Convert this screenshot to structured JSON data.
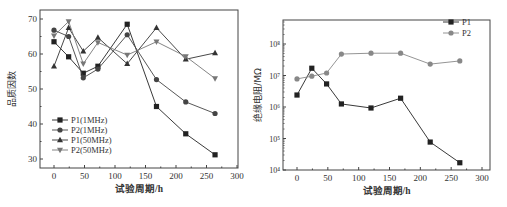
{
  "chart_data": [
    {
      "type": "line",
      "title": "",
      "xlabel": "试验周期/h",
      "ylabel": "品质因数",
      "xlim": [
        -25,
        300
      ],
      "ylim": [
        27.5,
        73
      ],
      "xticks": [
        0,
        50,
        100,
        150,
        200,
        250,
        300
      ],
      "yticks": [
        30,
        40,
        50,
        60,
        70
      ],
      "grid": false,
      "legend_position": "lower left",
      "x": [
        0,
        24,
        48,
        72,
        120,
        168,
        216,
        264
      ],
      "series": [
        {
          "name": "P1(1MHz)",
          "marker": "square",
          "color": "#222222",
          "values": [
            63.5,
            59.2,
            54.5,
            56.5,
            68.5,
            45.0,
            37.2,
            31.2
          ]
        },
        {
          "name": "P2(1MHz)",
          "marker": "circle",
          "color": "#444444",
          "values": [
            66.8,
            65.0,
            53.2,
            55.7,
            65.5,
            52.7,
            46.3,
            43.0
          ]
        },
        {
          "name": "P1(50MHz)",
          "marker": "triangle-up",
          "color": "#333333",
          "values": [
            56.5,
            67.5,
            60.8,
            64.7,
            57.2,
            67.5,
            58.5,
            60.3
          ]
        },
        {
          "name": "P2(50MHz)",
          "marker": "triangle-down",
          "color": "#777777",
          "values": [
            65.2,
            69.3,
            57.2,
            63.3,
            59.7,
            63.5,
            59.3,
            53.0
          ]
        }
      ]
    },
    {
      "type": "line",
      "title": "",
      "xlabel": "试验周期/h",
      "ylabel": "绝缘电阻/MΩ",
      "yscale": "log",
      "xlim": [
        -25,
        300
      ],
      "ylim": [
        10000,
        500000000
      ],
      "xticks": [
        0,
        50,
        100,
        150,
        200,
        250,
        300
      ],
      "yticks": [
        "10⁴",
        "10⁵",
        "10⁶",
        "10⁷",
        "10⁸"
      ],
      "grid": false,
      "legend_position": "upper right",
      "x": [
        0,
        24,
        48,
        72,
        120,
        168,
        216,
        264
      ],
      "series": [
        {
          "name": "P1",
          "marker": "square",
          "color": "#222222",
          "values": [
            2400000,
            17000000,
            5400000,
            1250000,
            930000,
            1900000,
            77000,
            17000
          ]
        },
        {
          "name": "P2",
          "marker": "circle",
          "color": "#888888",
          "values": [
            7800000,
            9500000,
            12000000,
            48000000,
            51000000,
            51000000,
            23000000,
            29000000
          ]
        }
      ]
    }
  ]
}
